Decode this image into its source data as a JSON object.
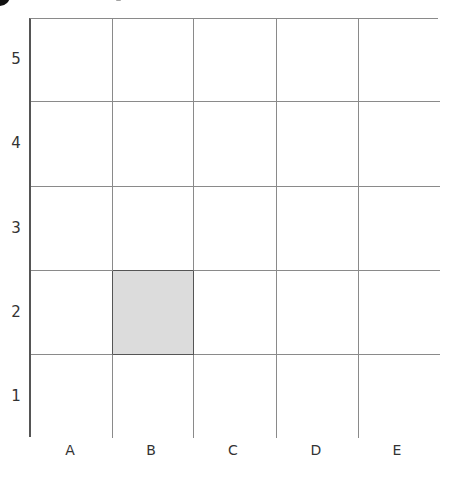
{
  "diagram": {
    "type": "coordinate-grid",
    "columns": [
      "A",
      "B",
      "C",
      "D",
      "E"
    ],
    "rows": [
      "5",
      "4",
      "3",
      "2",
      "1"
    ],
    "shaded_cells": [
      {
        "column": "B",
        "row": "2",
        "color": "#dcdcdc"
      }
    ],
    "colors": {
      "grid_line": "#8a8a8a",
      "axis_line": "#555555",
      "label_text": "#333333",
      "shaded_fill": "#dcdcdc"
    }
  },
  "axes": {
    "x_labels": [
      "A",
      "B",
      "C",
      "D",
      "E"
    ],
    "y_labels": [
      "5",
      "4",
      "3",
      "2",
      "1"
    ]
  }
}
